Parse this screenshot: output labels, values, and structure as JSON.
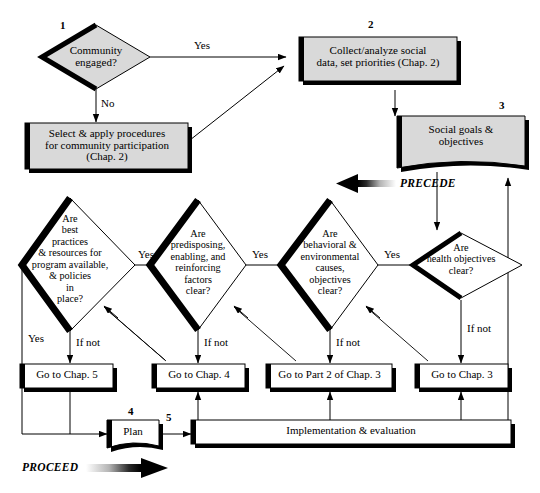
{
  "figure": {
    "type": "flowchart",
    "colors": {
      "node_fill": "#d9d9d9",
      "white_fill": "#ffffff",
      "stroke": "#000000",
      "shadow": "#000000"
    }
  },
  "step_numbers": {
    "one": "1",
    "two": "2",
    "three": "3",
    "four": "4",
    "five": "5"
  },
  "nodes": {
    "community_engaged": {
      "label": "Community\nengaged?",
      "shape": "diamond",
      "fill": "#d9d9d9"
    },
    "select_apply": {
      "label": "Select & apply procedures\nfor community participation\n(Chap. 2)",
      "shape": "rect",
      "fill": "#d9d9d9"
    },
    "collect_analyze": {
      "label": "Collect/analyze social\ndata, set priorities (Chap. 2)",
      "shape": "rect",
      "fill": "#d9d9d9"
    },
    "social_goals": {
      "label": "Social goals &\nobjectives",
      "shape": "document",
      "fill": "#d9d9d9"
    },
    "best_practices": {
      "label": "Are\nbest\npractices\n& resources for\nprogram available,\n& policies\nin\nplace?",
      "shape": "diamond",
      "fill": "#ffffff"
    },
    "predisposing": {
      "label": "Are\npredisposing,\nenabling, and\nreinforcing\nfactors\nclear?",
      "shape": "diamond",
      "fill": "#ffffff"
    },
    "behavioral": {
      "label": "Are\nbehavioral &\nenvironmental\ncauses,\nobjectives\nclear?",
      "shape": "diamond",
      "fill": "#ffffff"
    },
    "health_objectives": {
      "label": "Are\nhealth objectives\nclear?",
      "shape": "diamond",
      "fill": "#ffffff"
    },
    "go_chap5": {
      "label": "Go to Chap. 5",
      "shape": "rect",
      "fill": "#ffffff"
    },
    "go_chap4": {
      "label": "Go to Chap. 4",
      "shape": "rect",
      "fill": "#ffffff"
    },
    "go_part2_chap3": {
      "label": "Go to Part 2 of Chap. 3",
      "shape": "rect",
      "fill": "#ffffff"
    },
    "go_chap3": {
      "label": "Go to Chap. 3",
      "shape": "rect",
      "fill": "#ffffff"
    },
    "plan": {
      "label": "Plan",
      "shape": "document",
      "fill": "#ffffff"
    },
    "implementation": {
      "label": "Implementation & evaluation",
      "shape": "rect",
      "fill": "#ffffff"
    }
  },
  "edge_labels": {
    "yes_top": "Yes",
    "no_top": "No",
    "yes_1": "Yes",
    "yes_2": "Yes",
    "yes_3": "Yes",
    "yes_left": "Yes",
    "ifnot_1": "If not",
    "ifnot_2": "If not",
    "ifnot_3": "If not",
    "ifnot_4": "If not"
  },
  "phase_labels": {
    "precede": "PRECEDE",
    "proceed": "PROCEED"
  }
}
